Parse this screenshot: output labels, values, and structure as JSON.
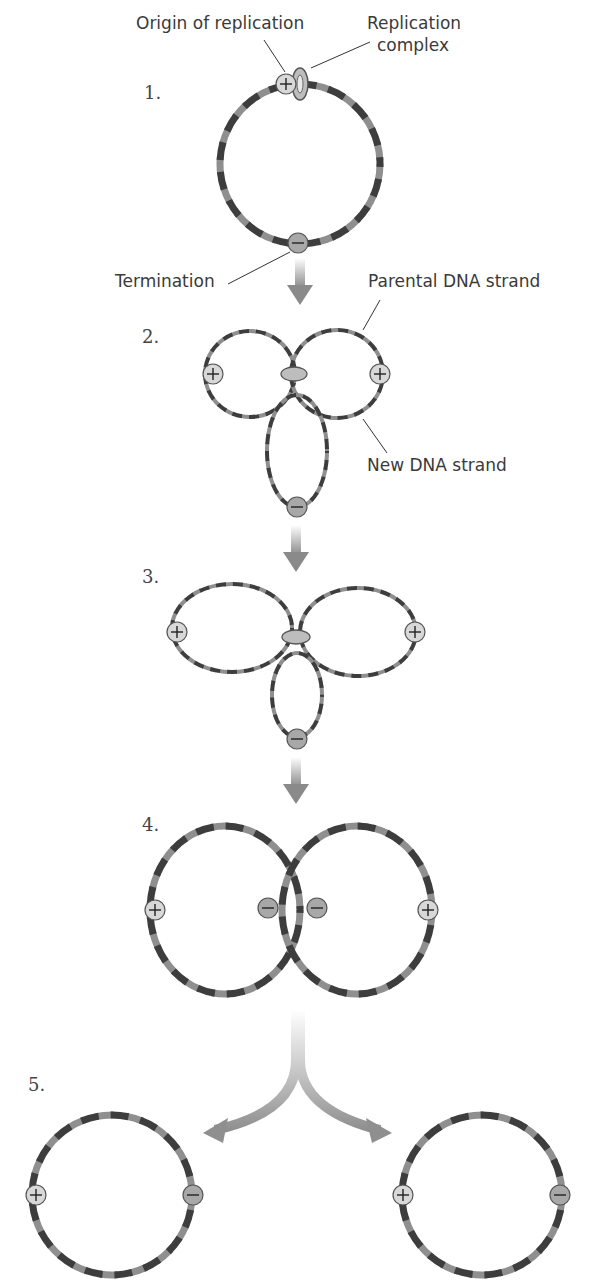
{
  "figure": {
    "labels": {
      "origin": "Origin of replication",
      "complex_line1": "Replication",
      "complex_line2": "complex",
      "termination": "Termination",
      "parental": "Parental DNA strand",
      "new_strand": "New DNA strand"
    },
    "steps": [
      {
        "number": "1.",
        "description": "Circular parental DNA with origin (+) and termination (−) sites"
      },
      {
        "number": "2.",
        "description": "Replication forks move bidirectionally from the origin"
      },
      {
        "number": "3.",
        "description": "Replication continues toward termination site"
      },
      {
        "number": "4.",
        "description": "Two interlocked daughter circles"
      },
      {
        "number": "5.",
        "description": "Separated daughter DNA circles"
      }
    ],
    "symbols": {
      "origin": "+",
      "termination": "−"
    },
    "colors": {
      "strand_dark": "#3d3d3d",
      "strand_light": "#8f8f8f",
      "marker_plus_fill": "#d8d8d8",
      "marker_minus_fill": "#a8a8a8",
      "arrow": "#9a9a9a",
      "complex_ring": "#9d9d9d"
    }
  }
}
